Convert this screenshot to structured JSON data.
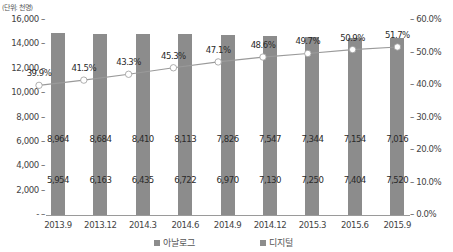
{
  "chart_data": {
    "type": "bar",
    "unit_label": "(단위: 천명)",
    "categories": [
      "2013.9",
      "2013.12",
      "2014.3",
      "2014.6",
      "2014.9",
      "2014.12",
      "2015.3",
      "2015.6",
      "2015.9"
    ],
    "series": [
      {
        "name": "아날로그",
        "type": "bar",
        "stacked": true,
        "values": [
          8964,
          8684,
          8410,
          8113,
          7826,
          7547,
          7344,
          7154,
          7016
        ]
      },
      {
        "name": "디지털",
        "type": "bar",
        "stacked": true,
        "values": [
          5954,
          6163,
          6435,
          6722,
          6970,
          7130,
          7250,
          7404,
          7520
        ]
      },
      {
        "name": "디지털 전환율",
        "type": "line",
        "axis": "right",
        "values": [
          39.9,
          41.5,
          43.3,
          45.3,
          47.1,
          48.6,
          49.7,
          50.9,
          51.7
        ],
        "labels": [
          "39.9%",
          "41.5%",
          "43.3%",
          "45.3%",
          "47.1%",
          "48.6%",
          "49.7%",
          "50.9%",
          "51.7%"
        ]
      }
    ],
    "left_axis": {
      "ticks": [
        "-",
        "2,000",
        "4,000",
        "6,000",
        "8,000",
        "10,000",
        "12,000",
        "14,000",
        "16,000"
      ],
      "ylim": [
        0,
        16000
      ]
    },
    "right_axis": {
      "ticks": [
        "0.0%",
        "10.0%",
        "20.0%",
        "30.0%",
        "40.0%",
        "50.0%",
        "60.0%"
      ],
      "ylim": [
        0,
        60
      ]
    },
    "analog_labels": [
      "8,964",
      "8,684",
      "8,410",
      "8,113",
      "7,826",
      "7,547",
      "7,344",
      "7,154",
      "7,016"
    ],
    "digital_labels": [
      "5,954",
      "6,163",
      "6,435",
      "6,722",
      "6,970",
      "7,130",
      "7,250",
      "7,404",
      "7,520"
    ],
    "legend": [
      "아날로그",
      "디지털"
    ],
    "legend_position": "bottom",
    "grid": false,
    "colors": {
      "bar": "#8c8c8c",
      "line": "#9a9a9a",
      "marker": "#ffffff"
    }
  }
}
